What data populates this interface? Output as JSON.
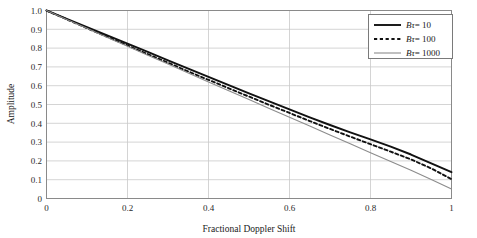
{
  "chart_data": {
    "type": "line",
    "title": "",
    "xlabel": "Fractional Doppler Shift",
    "ylabel": "Amplitude",
    "xlim": [
      0,
      1
    ],
    "ylim": [
      0,
      1
    ],
    "grid": true,
    "legend_position": "top-right",
    "xticks": [
      "0",
      "0.2",
      "0.4",
      "0.6",
      "0.8",
      "1"
    ],
    "xtick_values": [
      0,
      0.2,
      0.4,
      0.6,
      0.8,
      1
    ],
    "yticks": [
      "0",
      "0.1",
      "0.2",
      "0.3",
      "0.4",
      "0.5",
      "0.6",
      "0.7",
      "0.8",
      "0.9",
      "1.0"
    ],
    "ytick_values": [
      0,
      0.1,
      0.2,
      0.3,
      0.4,
      0.5,
      0.6,
      0.7,
      0.8,
      0.9,
      1.0
    ],
    "x": [
      0,
      0.05,
      0.1,
      0.15,
      0.2,
      0.25,
      0.3,
      0.35,
      0.4,
      0.45,
      0.5,
      0.55,
      0.6,
      0.65,
      0.7,
      0.75,
      0.8,
      0.85,
      0.9,
      0.95,
      1
    ],
    "series": [
      {
        "name": "Bτ = 10",
        "symbol": "Bτ",
        "value": "10",
        "style": "solid",
        "color": "#111111",
        "width": 1.9,
        "values": [
          1.0,
          0.956,
          0.912,
          0.868,
          0.824,
          0.78,
          0.735,
          0.691,
          0.647,
          0.603,
          0.559,
          0.516,
          0.474,
          0.432,
          0.391,
          0.352,
          0.315,
          0.276,
          0.234,
          0.187,
          0.14
        ]
      },
      {
        "name": "Bτ = 100",
        "symbol": "Bτ",
        "value": "100",
        "style": "dotted",
        "color": "#111111",
        "width": 1.9,
        "values": [
          1.0,
          0.953,
          0.906,
          0.86,
          0.814,
          0.768,
          0.722,
          0.676,
          0.631,
          0.586,
          0.542,
          0.498,
          0.455,
          0.412,
          0.37,
          0.329,
          0.289,
          0.249,
          0.208,
          0.16,
          0.103
        ]
      },
      {
        "name": "Bτ = 1000",
        "symbol": "Bτ",
        "value": "1000",
        "style": "solid",
        "color": "#8c8c8c",
        "width": 1.1,
        "values": [
          1.0,
          0.952,
          0.905,
          0.857,
          0.81,
          0.762,
          0.715,
          0.667,
          0.62,
          0.573,
          0.526,
          0.479,
          0.432,
          0.385,
          0.338,
          0.291,
          0.244,
          0.197,
          0.15,
          0.101,
          0.05
        ]
      }
    ]
  },
  "colors": {
    "grid": "#c9c9c9",
    "axis": "#8a8a8a",
    "background": "#ffffff",
    "text": "#1a1a1a",
    "legend_border": "#7a7a7a"
  }
}
